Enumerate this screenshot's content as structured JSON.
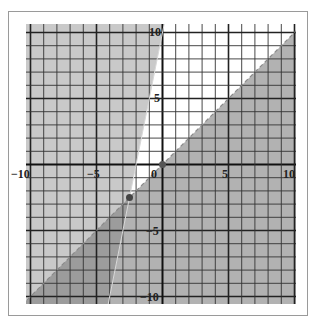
{
  "chart_data": {
    "type": "inequality_region",
    "title": "",
    "xlabel": "",
    "ylabel": "",
    "xlim": [
      -10.5,
      10.3
    ],
    "ylim": [
      -10.5,
      10.3
    ],
    "grid": true,
    "x_tick_labels": [
      "-10",
      "-5",
      "0",
      "5",
      "10"
    ],
    "y_tick_labels": [
      "10",
      "5",
      "-5",
      "-10"
    ],
    "boundaries": [
      {
        "name": "steep-line",
        "equation": "y = 5x + 10",
        "slope": 5,
        "intercept": 10,
        "style": "solid",
        "shaded_side": "above-left",
        "color": "#c9c9c9"
      },
      {
        "name": "diagonal-line",
        "equation": "y = x",
        "slope": 1,
        "intercept": 0,
        "style": "dashed",
        "shaded_side": "below-right",
        "color": "#b2b2b2"
      }
    ],
    "overlap_color": "#9c9c9c",
    "unshaded_color": "#ffffff",
    "points": [
      {
        "x": 0,
        "y": 0
      },
      {
        "x": -2.5,
        "y": -2.5
      }
    ]
  },
  "labels": {
    "x_neg10": "−10",
    "x_neg5": "−5",
    "x_0": "0",
    "x_5": "5",
    "x_10": "10",
    "y_10": "10",
    "y_5": "5",
    "y_neg5": "−5",
    "y_neg10": "−10"
  }
}
